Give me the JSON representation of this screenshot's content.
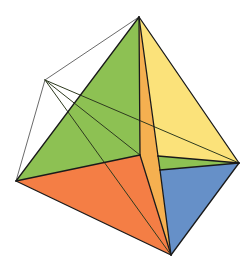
{
  "diagram": {
    "kind": "tetrahedron-with-wireframe-apex",
    "vertices": {
      "top": [
        139,
        17
      ],
      "left": [
        16,
        181
      ],
      "right": [
        239,
        163
      ],
      "bottom": [
        171,
        255
      ],
      "interior": [
        140,
        155
      ],
      "strip_right_upper": [
        158,
        156
      ],
      "strip_right_lower": [
        160,
        170
      ],
      "wire_apex": [
        45,
        80
      ]
    },
    "colors": {
      "green": "#8dc153",
      "orange": "#f47e45",
      "yellow": "#fbe27a",
      "blue": "#6690c8",
      "strip": "#f5b050",
      "edge": "#1a1a1a",
      "wire": "#6b6b6b",
      "background": "#ffffff"
    },
    "faces": [
      {
        "name": "green-face",
        "color": "green",
        "points": "139,17 16,181 140,155"
      },
      {
        "name": "orange-face",
        "color": "orange",
        "points": "16,181 140,155 171,255"
      },
      {
        "name": "strip-face",
        "color": "strip",
        "points": "139,17 140,155 171,255 160,170 158,156"
      },
      {
        "name": "yellow-face",
        "color": "yellow",
        "points": "139,17 158,156 239,163"
      },
      {
        "name": "green-sliver-face",
        "color": "green",
        "points": "158,156 239,163 160,170"
      },
      {
        "name": "blue-face",
        "color": "blue",
        "points": "160,170 239,163 171,255"
      }
    ],
    "edges": [
      [
        139,
        17,
        16,
        181
      ],
      [
        16,
        181,
        171,
        255
      ],
      [
        171,
        255,
        239,
        163
      ],
      [
        239,
        163,
        139,
        17
      ],
      [
        139,
        17,
        140,
        155
      ],
      [
        16,
        181,
        140,
        155
      ],
      [
        140,
        155,
        171,
        255
      ],
      [
        139,
        17,
        158,
        156
      ],
      [
        158,
        156,
        160,
        170
      ],
      [
        160,
        170,
        171,
        255
      ],
      [
        158,
        156,
        239,
        163
      ],
      [
        160,
        170,
        239,
        163
      ]
    ],
    "wire_lines": [
      [
        45,
        80,
        139,
        17
      ],
      [
        45,
        80,
        16,
        181
      ]
    ],
    "crossing_lines": [
      [
        45,
        80,
        239,
        163
      ],
      [
        45,
        80,
        140,
        155
      ],
      [
        45,
        80,
        171,
        255
      ]
    ]
  }
}
